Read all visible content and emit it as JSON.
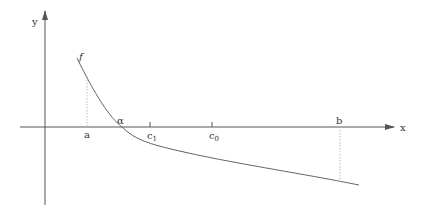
{
  "diagram": {
    "type": "function-graph",
    "colors": {
      "axis": "#555555",
      "curve": "#666666",
      "dashed": "#999999",
      "text": "#333333"
    },
    "axes": {
      "x_label": "x",
      "y_label": "y"
    },
    "curve": {
      "label": "f"
    },
    "points": {
      "a": {
        "label": "a"
      },
      "alpha": {
        "label": "α"
      },
      "c1": {
        "label": "c",
        "sub": "1"
      },
      "c0": {
        "label": "c",
        "sub": "0"
      },
      "b": {
        "label": "b"
      }
    }
  }
}
